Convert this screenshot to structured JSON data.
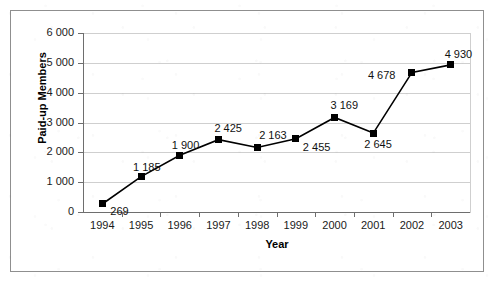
{
  "chart_data": {
    "type": "line",
    "title": "",
    "xlabel": "Year",
    "ylabel": "Paid-up Members",
    "categories": [
      "1994",
      "1995",
      "1996",
      "1997",
      "1998",
      "1999",
      "2000",
      "2001",
      "2002",
      "2003"
    ],
    "values": [
      269,
      1185,
      1900,
      2425,
      2163,
      2455,
      3169,
      2645,
      4678,
      4930
    ],
    "point_labels": [
      "269",
      "1 185",
      "1 900",
      "2 425",
      "2 163",
      "2 455",
      "3 169",
      "2 645",
      "4 678",
      "4 930"
    ],
    "ylim": [
      0,
      6000
    ],
    "ytick_values": [
      0,
      1000,
      2000,
      3000,
      4000,
      5000,
      6000
    ],
    "ytick_labels": [
      "0",
      "1 000",
      "2 000",
      "3 000",
      "4 000",
      "5 000",
      "6 000"
    ],
    "grid": true,
    "legend": "none",
    "marker": "square",
    "series_color": "#000000",
    "gridline_color": "#cfcfcf",
    "axis_color": "#6e6e6e",
    "background_color": "#ffffff"
  },
  "axes": {
    "x_title": "Year",
    "y_title": "Paid-up Members"
  }
}
